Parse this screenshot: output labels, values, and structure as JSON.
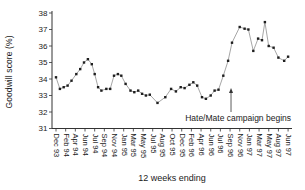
{
  "figure": {
    "y_axis_title": "Goodwill score (%)",
    "x_axis_title": "12 weeks ending",
    "annotation_text": "Hate/Mate campaign begins"
  },
  "colors": {
    "background": "#ffffff",
    "axis": "#333333",
    "line": "#8f8f8f",
    "marker": "#1f1f1f",
    "text": "#1a1a1a",
    "arrow": "#333333"
  },
  "chart_data": {
    "type": "line",
    "title": "",
    "ylabel": "Goodwill score (%)",
    "xlabel": "12 weeks ending",
    "ylim": [
      31,
      38
    ],
    "y_ticks": [
      31,
      32,
      33,
      34,
      35,
      36,
      37,
      38
    ],
    "grid": false,
    "legend": "none",
    "categories": [
      "Dec 93",
      "Feb 94",
      "Apr 94",
      "Jun 94",
      "Jul 94",
      "Sep 94",
      "Nov 94",
      "Jan 95",
      "Mar 95",
      "May 95",
      "Jul 95",
      "Aug 95",
      "Oct 95",
      "Dec 95",
      "Feb 96",
      "Apr 96",
      "Jun 96",
      "Jul 96",
      "Sep 96",
      "Nov 96",
      "Jan 97",
      "Mar 97",
      "May 97",
      "Aug 97",
      "Jun 97"
    ],
    "annotation": {
      "text": "Hate/Mate campaign begins",
      "arrow_x_tick": 18.1,
      "arrow_value_from": 32.0,
      "arrow_value_to": 33.4
    },
    "series": [
      {
        "name": "Goodwill score",
        "marker": "square",
        "points": [
          [
            0.0,
            34.1
          ],
          [
            0.4,
            33.4
          ],
          [
            0.8,
            33.5
          ],
          [
            1.2,
            33.6
          ],
          [
            1.6,
            33.9
          ],
          [
            2.1,
            34.3
          ],
          [
            2.5,
            34.6
          ],
          [
            2.9,
            35.0
          ],
          [
            3.3,
            35.2
          ],
          [
            3.7,
            34.9
          ],
          [
            4.0,
            34.3
          ],
          [
            4.35,
            33.5
          ],
          [
            4.7,
            33.3
          ],
          [
            5.2,
            33.4
          ],
          [
            5.6,
            33.4
          ],
          [
            6.0,
            34.2
          ],
          [
            6.4,
            34.3
          ],
          [
            6.75,
            34.2
          ],
          [
            7.2,
            33.7
          ],
          [
            7.7,
            33.3
          ],
          [
            8.1,
            33.2
          ],
          [
            8.5,
            33.3
          ],
          [
            8.9,
            33.1
          ],
          [
            9.3,
            33.0
          ],
          [
            9.7,
            33.05
          ],
          [
            10.5,
            32.55
          ],
          [
            11.3,
            32.9
          ],
          [
            11.9,
            33.4
          ],
          [
            12.4,
            33.25
          ],
          [
            12.9,
            33.5
          ],
          [
            13.3,
            33.45
          ],
          [
            13.8,
            33.65
          ],
          [
            14.2,
            33.8
          ],
          [
            14.6,
            33.6
          ],
          [
            15.1,
            32.9
          ],
          [
            15.5,
            32.8
          ],
          [
            16.0,
            33.0
          ],
          [
            16.4,
            33.3
          ],
          [
            16.8,
            33.35
          ],
          [
            17.3,
            34.2
          ],
          [
            17.8,
            35.1
          ],
          [
            18.2,
            36.2
          ],
          [
            19.0,
            37.15
          ],
          [
            19.5,
            37.05
          ],
          [
            19.9,
            37.0
          ],
          [
            20.4,
            35.7
          ],
          [
            20.9,
            36.45
          ],
          [
            21.3,
            36.35
          ],
          [
            21.6,
            37.45
          ],
          [
            22.0,
            36.0
          ],
          [
            22.5,
            35.9
          ],
          [
            23.0,
            35.3
          ],
          [
            23.6,
            35.1
          ],
          [
            24.0,
            35.35
          ]
        ]
      }
    ]
  }
}
